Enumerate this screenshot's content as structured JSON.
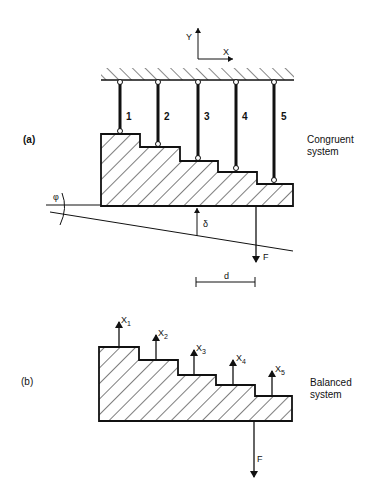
{
  "axes": {
    "y_label": "Y",
    "x_label": "X"
  },
  "panel_a": {
    "label": "(a)",
    "caption_line1": "Congruent",
    "caption_line2": "system",
    "rods": [
      {
        "label": "1"
      },
      {
        "label": "2"
      },
      {
        "label": "3"
      },
      {
        "label": "4"
      },
      {
        "label": "5"
      }
    ],
    "angle_label": "φ",
    "displacement_label": "δ",
    "force_label": "F",
    "distance_label": "d"
  },
  "panel_b": {
    "label": "(b)",
    "caption_line1": "Balanced",
    "caption_line2": "system",
    "forces": [
      {
        "label": "X",
        "sub": "1"
      },
      {
        "label": "X",
        "sub": "2"
      },
      {
        "label": "X",
        "sub": "3"
      },
      {
        "label": "X",
        "sub": "4"
      },
      {
        "label": "X",
        "sub": "5"
      }
    ],
    "force_label": "F"
  },
  "colors": {
    "ink": "#111111",
    "background": "#ffffff"
  }
}
